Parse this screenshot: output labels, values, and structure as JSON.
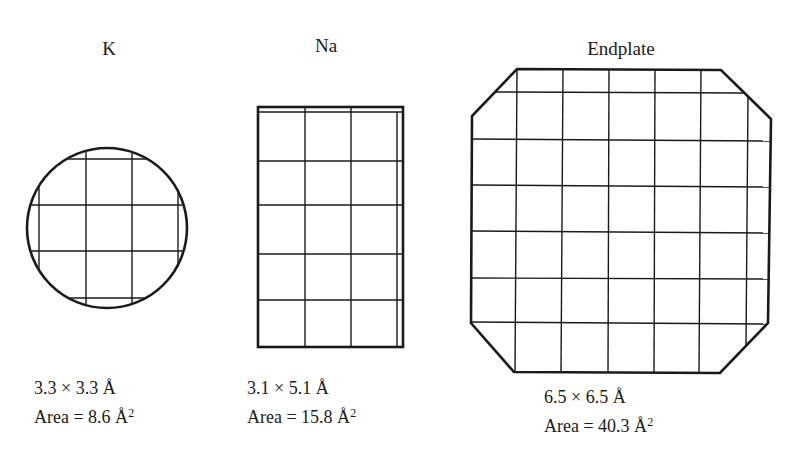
{
  "diagram": {
    "panels": [
      {
        "id": "K",
        "title": "K",
        "shape": "circle",
        "dimensions": "3.3 × 3.3 Å",
        "area_label": "Area = 8.6 Å",
        "area_exp": "2",
        "width_A": 3.3,
        "height_A": 3.3,
        "area_A2": 8.6
      },
      {
        "id": "Na",
        "title": "Na",
        "shape": "rectangle",
        "dimensions": "3.1 × 5.1 Å",
        "area_label": "Area = 15.8 Å",
        "area_exp": "2",
        "width_A": 3.1,
        "height_A": 5.1,
        "area_A2": 15.8
      },
      {
        "id": "Endplate",
        "title": "Endplate",
        "shape": "octagon",
        "dimensions": "6.5 × 6.5 Å",
        "area_label": "Area = 40.3 Å",
        "area_exp": "2",
        "width_A": 6.5,
        "height_A": 6.5,
        "area_A2": 40.3
      }
    ],
    "colors": {
      "stroke": "#1a1a1a",
      "background": "#ffffff"
    }
  }
}
